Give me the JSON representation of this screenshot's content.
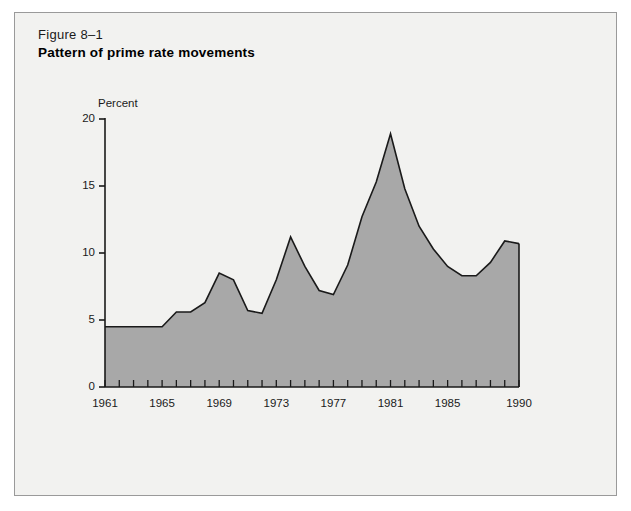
{
  "figure": {
    "number": "Figure 8–1",
    "title": "Pattern of prime rate movements"
  },
  "colors": {
    "page_background": "#ffffff",
    "panel_background": "#f2f2f0",
    "panel_border": "#9a9a9a",
    "area_fill": "#a8a8a8",
    "line_stroke": "#1a1a1a",
    "axis": "#1a1a1a",
    "text": "#1a1a1a"
  },
  "chart_data": {
    "type": "area",
    "title": "Pattern of prime rate movements",
    "subtitle": "Figure 8–1",
    "xlabel": "",
    "ylabel": "Percent",
    "ylabel_position": "above-axis-top",
    "grid": false,
    "legend": null,
    "xlim": [
      1961,
      1990
    ],
    "ylim": [
      0,
      20
    ],
    "ytick_labels": [
      "20",
      "15",
      "10",
      "5",
      "0"
    ],
    "ytick_values": [
      20,
      15,
      10,
      5,
      0
    ],
    "xtick_labels": [
      "1961",
      "1965",
      "1969",
      "1973",
      "1977",
      "1981",
      "1985",
      "1990"
    ],
    "xtick_values": [
      1961,
      1965,
      1969,
      1973,
      1977,
      1981,
      1985,
      1990
    ],
    "xtick_minor_every_year": true,
    "x": [
      1961,
      1962,
      1963,
      1964,
      1965,
      1966,
      1967,
      1968,
      1969,
      1970,
      1971,
      1972,
      1973,
      1974,
      1975,
      1976,
      1977,
      1978,
      1979,
      1980,
      1981,
      1982,
      1983,
      1984,
      1985,
      1986,
      1987,
      1988,
      1989,
      1990
    ],
    "values": [
      4.5,
      4.5,
      4.5,
      4.5,
      4.5,
      5.6,
      5.6,
      6.3,
      8.5,
      8.0,
      5.7,
      5.5,
      8.0,
      11.2,
      9.0,
      7.2,
      6.9,
      9.1,
      12.7,
      15.3,
      18.9,
      14.8,
      12.0,
      10.3,
      9.0,
      8.3,
      8.3,
      9.3,
      10.9,
      10.7
    ],
    "series": [
      {
        "name": "Prime rate",
        "values": [
          4.5,
          4.5,
          4.5,
          4.5,
          4.5,
          5.6,
          5.6,
          6.3,
          8.5,
          8.0,
          5.7,
          5.5,
          8.0,
          11.2,
          9.0,
          7.2,
          6.9,
          9.1,
          12.7,
          15.3,
          18.9,
          14.8,
          12.0,
          10.3,
          9.0,
          8.3,
          8.3,
          9.3,
          10.9,
          10.7
        ]
      }
    ]
  },
  "axes": {
    "y_title": "Percent"
  }
}
